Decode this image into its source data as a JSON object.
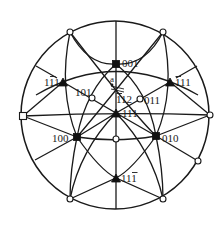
{
  "diagram": {
    "type": "stereographic-projection",
    "colors": {
      "line": "#1a1a1a",
      "background": "#ffffff"
    },
    "primitive_circle": {
      "cx": 115,
      "cy": 115,
      "r": 94
    },
    "poles": [
      {
        "id": "001",
        "label": "001",
        "bar": null,
        "symbol": "square",
        "x": 116,
        "y": 64
      },
      {
        "id": "1-11",
        "label": "111",
        "bar": 0,
        "symbol": "triangle",
        "x": 170,
        "y": 82
      },
      {
        "id": "11-1left",
        "label": "111",
        "bar": 1,
        "symbol": "triangle",
        "x": 63,
        "y": 82
      },
      {
        "id": "101",
        "label": "101",
        "bar": null,
        "symbol": "circle",
        "x": 92,
        "y": 98
      },
      {
        "id": "011",
        "label": "011",
        "bar": null,
        "symbol": "circle",
        "x": 140,
        "y": 99
      },
      {
        "id": "111",
        "label": "111",
        "bar": null,
        "symbol": "triangle",
        "x": 116,
        "y": 113
      },
      {
        "id": "100",
        "label": "100",
        "bar": null,
        "symbol": "square",
        "x": 77,
        "y": 137
      },
      {
        "id": "010",
        "label": "010",
        "bar": null,
        "symbol": "square",
        "x": 156,
        "y": 136
      },
      {
        "id": "1-10",
        "label": "",
        "bar": null,
        "symbol": "circle",
        "x": 116,
        "y": 139
      },
      {
        "id": "11-1",
        "label": "111",
        "bar": 2,
        "symbol": "triangle",
        "x": 116,
        "y": 178
      }
    ],
    "boundary_poles": [
      {
        "symbol": "circle",
        "x": 70,
        "y": 32
      },
      {
        "symbol": "circle",
        "x": 163,
        "y": 32
      },
      {
        "symbol": "circle",
        "x": 210,
        "y": 115
      },
      {
        "symbol": "circle",
        "x": 198,
        "y": 161
      },
      {
        "symbol": "circle",
        "x": 70,
        "y": 199
      },
      {
        "symbol": "circle",
        "x": 163,
        "y": 199
      },
      {
        "symbol": "square",
        "x": 23,
        "y": 116
      }
    ],
    "labels": {
      "p001": "001",
      "p1b11": "111",
      "p11b1": "111",
      "p101": "101",
      "p011": "011",
      "p111": "111",
      "p100": "100",
      "p010": "010",
      "p111b": "111",
      "p1b12": "112",
      "marker_a": "a"
    }
  }
}
